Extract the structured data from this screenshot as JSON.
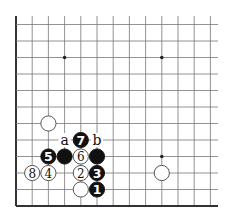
{
  "diagram": {
    "type": "go-board-fragment",
    "edges": [
      "left",
      "bottom"
    ],
    "grid": {
      "columns": 13,
      "rows": 12,
      "origin_x": 16,
      "origin_y_bottom": 206,
      "spacing_x": 16.2,
      "spacing_y": 16.5,
      "line_color": "#777777",
      "edge_color": "#333333",
      "extend_right": 218,
      "extend_top": 16
    },
    "star_points": [
      {
        "col": 3,
        "row": 9
      },
      {
        "col": 9,
        "row": 9
      },
      {
        "col": 9,
        "row": 3
      }
    ],
    "stones": [
      {
        "color": "white",
        "col": 2,
        "row": 5,
        "label": ""
      },
      {
        "color": "white",
        "col": 9,
        "row": 2,
        "label": ""
      },
      {
        "color": "white",
        "col": 4,
        "row": 1,
        "label": ""
      },
      {
        "color": "black",
        "col": 3,
        "row": 3,
        "label": ""
      },
      {
        "color": "black",
        "col": 5,
        "row": 3,
        "label": ""
      },
      {
        "color": "black",
        "col": 5,
        "row": 1,
        "label": "1"
      },
      {
        "color": "white",
        "col": 4,
        "row": 2,
        "label": "2"
      },
      {
        "color": "black",
        "col": 5,
        "row": 2,
        "label": "3"
      },
      {
        "color": "white",
        "col": 2,
        "row": 2,
        "label": "4"
      },
      {
        "color": "black",
        "col": 2,
        "row": 3,
        "label": "5"
      },
      {
        "color": "white",
        "col": 4,
        "row": 3,
        "label": "6"
      },
      {
        "color": "black",
        "col": 4,
        "row": 4,
        "label": "7"
      },
      {
        "color": "white",
        "col": 1,
        "row": 2,
        "label": "8"
      }
    ],
    "markers": [
      {
        "text": "a",
        "col": 3,
        "row": 4
      },
      {
        "text": "b",
        "col": 5,
        "row": 4
      }
    ]
  }
}
